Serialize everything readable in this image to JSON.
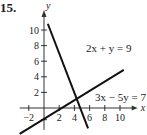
{
  "problem_number": "15.",
  "chart_data": {
    "type": "line",
    "title": "",
    "xlabel": "x",
    "ylabel": "y",
    "xlim": [
      -3,
      12
    ],
    "ylim": [
      -3,
      11
    ],
    "x_ticks": [
      -2,
      2,
      4,
      6,
      8,
      10
    ],
    "y_ticks": [
      2,
      4,
      6,
      8,
      10
    ],
    "x_tick_labels": [
      "−2",
      "2",
      "4",
      "6",
      "8",
      "10"
    ],
    "y_tick_labels": [
      "2",
      "4",
      "6",
      "8",
      "10"
    ],
    "grid": false,
    "series": [
      {
        "name": "2x + y = 9",
        "equation": "y = 9 - 2x",
        "x": [
          0.5,
          5.8
        ],
        "y": [
          10.8,
          -2.6
        ]
      },
      {
        "name": "3x − 5y = 7",
        "equation": "y = (3x - 7)/5",
        "x": [
          -3.2,
          10.5
        ],
        "y": [
          -3.32,
          4.9
        ]
      }
    ],
    "annotations": [
      {
        "text": "2x + y = 9",
        "near": "upper line label"
      },
      {
        "text": "3x − 5y = 7",
        "near": "lower line label"
      }
    ],
    "intersection": {
      "x": 4,
      "y": 1
    }
  }
}
